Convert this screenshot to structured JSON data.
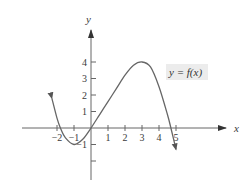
{
  "chart_data": {
    "type": "line",
    "title": "",
    "xlabel": "x",
    "ylabel": "y",
    "xlim": [
      -2.5,
      6
    ],
    "ylim": [
      -3,
      5
    ],
    "grid": false,
    "x_ticks": [
      -2,
      -1,
      1,
      2,
      3,
      4,
      5
    ],
    "x_tick_labels": [
      "−2",
      "−1",
      "1",
      "2",
      "3",
      "4",
      "5"
    ],
    "y_ticks": [
      -2,
      -1,
      1,
      2,
      3,
      4
    ],
    "y_tick_labels": [
      "",
      "−1",
      "1",
      "2",
      "3",
      "4"
    ],
    "series": [
      {
        "name": "y = f(x)",
        "x": [
          -2.3,
          -2,
          -1.8,
          -1.5,
          -1,
          -0.5,
          0,
          0.5,
          1,
          1.5,
          2,
          2.5,
          3,
          3.5,
          4,
          4.5,
          4.7,
          5
        ],
        "y": [
          1.8,
          0.6,
          0,
          -0.6,
          -1,
          -0.7,
          0,
          0.8,
          1.6,
          2.4,
          3.2,
          3.8,
          4,
          3.7,
          2.5,
          0.8,
          0,
          -1.3
        ],
        "arrows": "both"
      }
    ],
    "annotations": [
      {
        "text": "y = f(x)",
        "x": 4.5,
        "y": 3.3
      }
    ]
  },
  "labels": {
    "x_axis": "x",
    "y_axis": "y",
    "function": "y = f(x)"
  }
}
